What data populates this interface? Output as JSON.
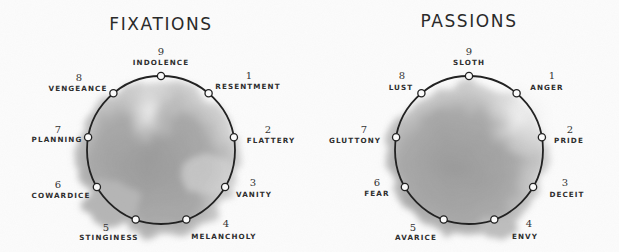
{
  "diagrams": [
    {
      "id": "fixations",
      "title": "FIXATIONS",
      "center": [
        161,
        150
      ],
      "radius": 74,
      "points": [
        {
          "number": "9",
          "label": "INDOLENCE"
        },
        {
          "number": "1",
          "label": "RESENTMENT"
        },
        {
          "number": "2",
          "label": "FLATTERY"
        },
        {
          "number": "3",
          "label": "VANITY"
        },
        {
          "number": "4",
          "label": "MELANCHOLY"
        },
        {
          "number": "5",
          "label": "STINGINESS"
        },
        {
          "number": "6",
          "label": "COWARDICE"
        },
        {
          "number": "7",
          "label": "PLANNING"
        },
        {
          "number": "8",
          "label": "VENGEANCE"
        }
      ]
    },
    {
      "id": "passions",
      "title": "PASSIONS",
      "center": [
        469,
        150
      ],
      "radius": 74,
      "points": [
        {
          "number": "9",
          "label": "SLOTH"
        },
        {
          "number": "1",
          "label": "ANGER"
        },
        {
          "number": "2",
          "label": "PRIDE"
        },
        {
          "number": "3",
          "label": "DECEIT"
        },
        {
          "number": "4",
          "label": "ENVY"
        },
        {
          "number": "5",
          "label": "AVARICE"
        },
        {
          "number": "6",
          "label": "FEAR"
        },
        {
          "number": "7",
          "label": "GLUTTONY"
        },
        {
          "number": "8",
          "label": "LUST"
        }
      ]
    }
  ],
  "colors": {
    "background": "#fcfcfc",
    "circle_stroke": "#222222",
    "wash_dark": "#8f8f8f",
    "wash_light": "#e6e6e6",
    "text": "#2b2b2b"
  }
}
